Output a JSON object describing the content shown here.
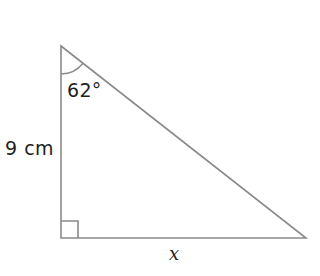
{
  "figure": {
    "type": "right-triangle-diagram",
    "background_color": "#ffffff",
    "stroke_color": "#8a8a8a",
    "text_color": "#231f20",
    "stroke_width": 1.6
  },
  "labels": {
    "angle": "62°",
    "vertical_leg": "9 cm",
    "base": "x"
  },
  "geometry": {
    "vertices": {
      "apex": {
        "x": 61,
        "y": 46
      },
      "right_angle": {
        "x": 61,
        "y": 238
      },
      "far": {
        "x": 306,
        "y": 238
      }
    },
    "angle_arc": {
      "center_x": 61,
      "center_y": 46,
      "radius": 28
    },
    "right_angle_marker": {
      "x": 61,
      "y": 221,
      "size": 17
    }
  },
  "chart_data": {
    "type": "diagram",
    "shape": "right triangle",
    "known_angle_degrees": 62,
    "known_side_label": "9 cm",
    "known_side_length": 9,
    "known_side_units": "cm",
    "known_side_position": "vertical leg (adjacent to 62° angle)",
    "unknown_side_label": "x",
    "unknown_side_position": "horizontal base (opposite the 62° angle)",
    "right_angle_position": "bottom-left vertex",
    "angle_vertex_position": "top vertex"
  }
}
